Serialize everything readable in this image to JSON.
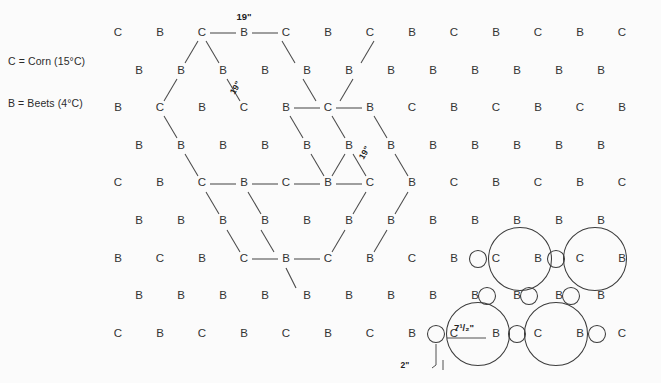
{
  "figure": {
    "title_fragment": "",
    "background": "#fbfbfb",
    "ink": "#333333"
  },
  "legend": {
    "line1": "C = Corn (15°C)",
    "line2": "B = Beets (4°C)"
  },
  "labels": {
    "corn": "C",
    "beets": "B",
    "spacing_top": "19\"",
    "spacing_left_diag": "19\"",
    "spacing_right_diag": "19\"",
    "circle_diameter": "7¹/₂\"",
    "small_circle_diameter": "2\""
  },
  "grid": {
    "rows": 9,
    "row_spacing_px": 37.6,
    "col_spacing_px": 42.0,
    "origin_x": 118,
    "origin_y": 33,
    "odd_row_offset_px": 21,
    "rows_data": [
      {
        "index": 0,
        "offset": false,
        "cells": [
          "C",
          "B",
          "C",
          "B",
          "C",
          "B",
          "C",
          "B",
          "C",
          "B",
          "C",
          "B",
          "C"
        ]
      },
      {
        "index": 1,
        "offset": true,
        "cells": [
          "B",
          "B",
          "B",
          "B",
          "B",
          "B",
          "B",
          "B",
          "B",
          "B",
          "B",
          "B"
        ]
      },
      {
        "index": 2,
        "offset": false,
        "cells": [
          "B",
          "C",
          "B",
          "C",
          "B",
          "C",
          "B",
          "C",
          "B",
          "C",
          "B",
          "C",
          "B"
        ]
      },
      {
        "index": 3,
        "offset": true,
        "cells": [
          "B",
          "B",
          "B",
          "B",
          "B",
          "B",
          "B",
          "B",
          "B",
          "B",
          "B",
          "B"
        ]
      },
      {
        "index": 4,
        "offset": false,
        "cells": [
          "C",
          "B",
          "C",
          "B",
          "C",
          "B",
          "C",
          "B",
          "C",
          "B",
          "C",
          "B",
          "C"
        ]
      },
      {
        "index": 5,
        "offset": true,
        "cells": [
          "B",
          "B",
          "B",
          "B",
          "B",
          "B",
          "B",
          "B",
          "B",
          "B",
          "B",
          "B"
        ]
      },
      {
        "index": 6,
        "offset": false,
        "cells": [
          "B",
          "C",
          "B",
          "C",
          "B",
          "C",
          "B",
          "C",
          "B",
          "C",
          "B",
          "C",
          "B"
        ]
      },
      {
        "index": 7,
        "offset": true,
        "cells": [
          "B",
          "B",
          "B",
          "B",
          "B",
          "B",
          "B",
          "B",
          "B",
          "B",
          "B",
          "B"
        ]
      },
      {
        "index": 8,
        "offset": false,
        "cells": [
          "C",
          "B",
          "C",
          "B",
          "C",
          "B",
          "C",
          "B",
          "C",
          "B",
          "C",
          "B",
          "C"
        ]
      }
    ]
  },
  "circles": {
    "large_diameter_px": 63,
    "small_diameter_px": 17,
    "large": [
      {
        "label": "C",
        "cx": 520,
        "cy": 259
      },
      {
        "label": "C",
        "cx": 595,
        "cy": 259
      },
      {
        "label": "C",
        "cx": 478,
        "cy": 334
      },
      {
        "label": "C",
        "cx": 556,
        "cy": 334
      }
    ],
    "small": [
      {
        "label": "B",
        "cx": 478,
        "cy": 259
      },
      {
        "label": "B",
        "cx": 556,
        "cy": 259
      },
      {
        "label": "B",
        "cx": 487,
        "cy": 296
      },
      {
        "label": "B",
        "cx": 529,
        "cy": 296
      },
      {
        "label": "B",
        "cx": 571,
        "cy": 296
      },
      {
        "label": "B",
        "cx": 436,
        "cy": 334
      },
      {
        "label": "B",
        "cx": 517,
        "cy": 334
      },
      {
        "label": "B",
        "cx": 597,
        "cy": 334
      }
    ]
  },
  "hexagons": {
    "note": "two hexagonal spacing overlays drawn over the planting grid",
    "count": 2
  }
}
